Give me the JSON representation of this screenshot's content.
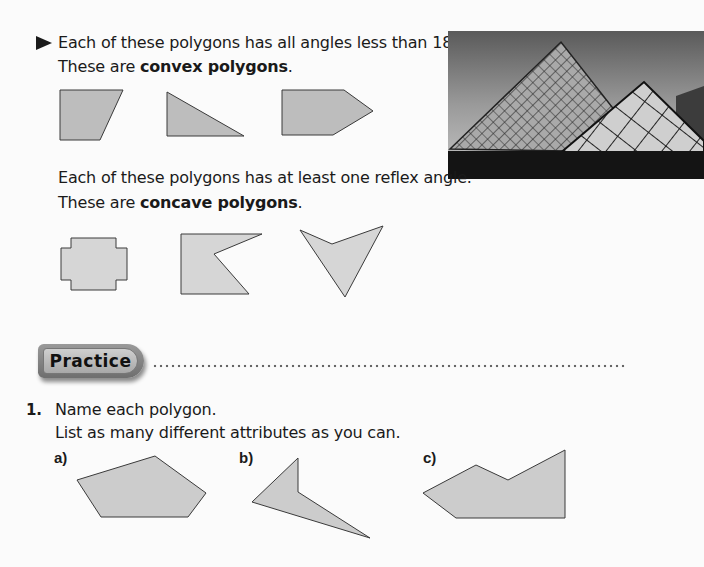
{
  "intro": {
    "convex_line1": "Each of these polygons has all angles less than 180°.",
    "convex_line2_prefix": "These are ",
    "convex_line2_bold": "convex polygons",
    "convex_line2_suffix": ".",
    "concave_line1": "Each of these polygons has at least one reflex angle.",
    "concave_line2_prefix": "These are ",
    "concave_line2_bold": "concave polygons",
    "concave_line2_suffix": "."
  },
  "photo": {
    "subject": "glass-pyramid-photo"
  },
  "practice": {
    "badge_label": "Practice",
    "question_number": "1.",
    "question_line1": "Name each polygon.",
    "question_line2": "List as many different attributes as you can.",
    "parts": [
      {
        "label": "a)"
      },
      {
        "label": "b)"
      },
      {
        "label": "c)"
      }
    ]
  },
  "colors": {
    "convex_fill": "#bdbdbd",
    "concave_fill": "#d6d6d6",
    "practice_fill": "#cccccc",
    "stroke": "#3a3a3a"
  }
}
